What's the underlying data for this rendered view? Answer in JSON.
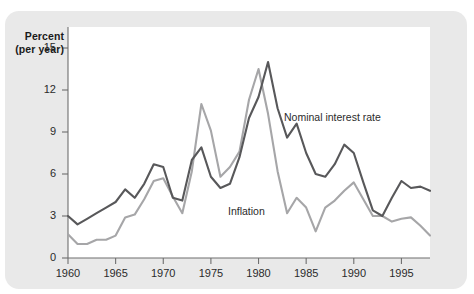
{
  "figure": {
    "axis_label_line1": "Percent",
    "axis_label_line2": "(per year)"
  },
  "annotations": {
    "nominal_label": "Nominal interest rate",
    "inflation_label": "Inflation"
  },
  "colors": {
    "panel_background": "#e9e9e9",
    "plot_background": "#ffffff",
    "axis": "#6e6e6e",
    "nominal_line": "#58585a",
    "inflation_line": "#a6a6a8",
    "text": "#1a1a1a"
  },
  "chart_data": {
    "type": "line",
    "title": "",
    "subtitle": "",
    "xlabel": "",
    "ylabel": "Percent (per year)",
    "xlim": [
      1960,
      1998
    ],
    "ylim": [
      0,
      16.5
    ],
    "yticks": [
      0,
      3,
      6,
      9,
      12,
      15
    ],
    "ytick_labels": [
      "0",
      "3",
      "6",
      "9",
      "12",
      "15"
    ],
    "xticks": [
      1960,
      1965,
      1970,
      1975,
      1980,
      1985,
      1990,
      1995
    ],
    "xtick_labels": [
      "1960",
      "1965",
      "1970",
      "1975",
      "1980",
      "1985",
      "1990",
      "1995"
    ],
    "grid": false,
    "legend": "inline-annotations",
    "x": [
      1960,
      1961,
      1962,
      1963,
      1964,
      1965,
      1966,
      1967,
      1968,
      1969,
      1970,
      1971,
      1972,
      1973,
      1974,
      1975,
      1976,
      1977,
      1978,
      1979,
      1980,
      1981,
      1982,
      1983,
      1984,
      1985,
      1986,
      1987,
      1988,
      1989,
      1990,
      1991,
      1992,
      1993,
      1994,
      1995,
      1996,
      1997,
      1998
    ],
    "series": [
      {
        "name": "Nominal interest rate",
        "color": "#58585a",
        "values": [
          3.0,
          2.4,
          2.8,
          3.2,
          3.6,
          4.0,
          4.9,
          4.3,
          5.3,
          6.7,
          6.5,
          4.3,
          4.1,
          7.0,
          7.9,
          5.8,
          5.0,
          5.3,
          7.2,
          10.0,
          11.5,
          14.0,
          10.7,
          8.6,
          9.6,
          7.5,
          6.0,
          5.8,
          6.7,
          8.1,
          7.5,
          5.4,
          3.4,
          3.0,
          4.3,
          5.5,
          5.0,
          5.1,
          4.8
        ]
      },
      {
        "name": "Inflation",
        "color": "#a6a6a8",
        "values": [
          1.7,
          1.0,
          1.0,
          1.3,
          1.3,
          1.6,
          2.9,
          3.1,
          4.2,
          5.5,
          5.7,
          4.4,
          3.2,
          6.2,
          11.0,
          9.1,
          5.8,
          6.5,
          7.6,
          11.3,
          13.5,
          10.3,
          6.2,
          3.2,
          4.3,
          3.6,
          1.9,
          3.6,
          4.1,
          4.8,
          5.4,
          4.2,
          3.0,
          3.0,
          2.6,
          2.8,
          2.9,
          2.3,
          1.6
        ]
      }
    ]
  }
}
